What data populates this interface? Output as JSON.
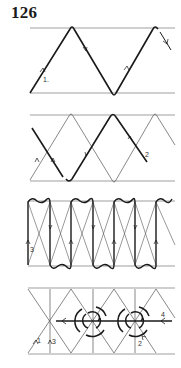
{
  "figure_number": "126",
  "panels": [
    {
      "id": 1,
      "description": "Single zigzag wire between two horizontal rails with direction arrows",
      "labels": [
        "1."
      ]
    },
    {
      "id": 2,
      "description": "Second zigzag crossing the first, offset by half period",
      "labels": [
        "2"
      ]
    },
    {
      "id": 3,
      "description": "Vertical strands with wavy loops at top and bottom rails, crossed diagonals",
      "labels": [
        "3"
      ]
    },
    {
      "id": 4,
      "description": "Lattice with two circular knot rosettes on a horizontal strand",
      "labels": [
        "1",
        "3",
        "4",
        "2"
      ]
    }
  ],
  "colors": {
    "ink": "#1a1a1a",
    "thin": "#555555",
    "rail": "#777777"
  }
}
